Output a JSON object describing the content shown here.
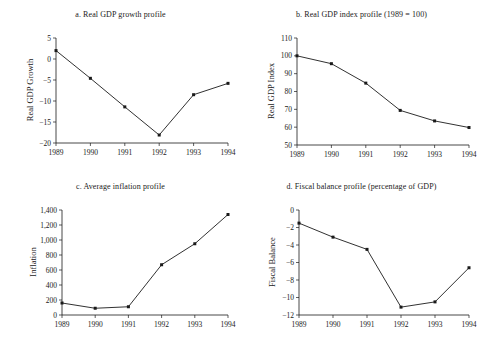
{
  "figure": {
    "background": "#ffffff",
    "ink": "#1a1a1a",
    "panels": [
      "a",
      "b",
      "c",
      "d"
    ]
  },
  "chart_data": [
    {
      "id": "a",
      "type": "line",
      "title": "a. Real GDP growth profile",
      "xlabel": "",
      "ylabel": "Real GDP Growth",
      "categories": [
        "1989",
        "1990",
        "1991",
        "1992",
        "1993",
        "1994"
      ],
      "x": [
        1989,
        1990,
        1991,
        1992,
        1993,
        1994
      ],
      "values": [
        2.0,
        -4.6,
        -11.4,
        -18.1,
        -8.5,
        -5.8
      ],
      "ylim": [
        -20,
        5
      ],
      "yticks": [
        5,
        0,
        -5,
        -10,
        -15,
        -20
      ],
      "ytick_labels": [
        "5",
        "0",
        "−5",
        "−10",
        "−15",
        "−20"
      ],
      "grid": false,
      "legend": "none",
      "marker": "square"
    },
    {
      "id": "b",
      "type": "line",
      "title": "b. Real GDP index profile (1989 = 100)",
      "xlabel": "",
      "ylabel": "Real GDP Index",
      "categories": [
        "1989",
        "1990",
        "1991",
        "1992",
        "1993",
        "1994"
      ],
      "x": [
        1989,
        1990,
        1991,
        1992,
        1993,
        1994
      ],
      "values": [
        100.0,
        95.6,
        84.7,
        69.4,
        63.5,
        59.8
      ],
      "ylim": [
        50,
        110
      ],
      "yticks": [
        110,
        100,
        90,
        80,
        70,
        60,
        50
      ],
      "ytick_labels": [
        "110",
        "100",
        "90",
        "80",
        "70",
        "60",
        "50"
      ],
      "grid": false,
      "legend": "none",
      "marker": "square"
    },
    {
      "id": "c",
      "type": "line",
      "title": "c. Average inflation profile",
      "xlabel": "",
      "ylabel": "Inflation",
      "categories": [
        "1989",
        "1990",
        "1991",
        "1992",
        "1993",
        "1994"
      ],
      "x": [
        1989,
        1990,
        1991,
        1992,
        1993,
        1994
      ],
      "values": [
        160,
        90,
        110,
        670,
        950,
        1340
      ],
      "ylim": [
        0,
        1400
      ],
      "yticks": [
        1400,
        1200,
        1000,
        800,
        600,
        400,
        200,
        0
      ],
      "ytick_labels": [
        "1,400",
        "1,200",
        "1,000",
        "800",
        "600",
        "400",
        "200",
        "0"
      ],
      "grid": false,
      "legend": "none",
      "marker": "square"
    },
    {
      "id": "d",
      "type": "line",
      "title": "d. Fiscal balance profile (percentage of GDP)",
      "xlabel": "",
      "ylabel": "Fiscal Balance",
      "categories": [
        "1989",
        "1990",
        "1991",
        "1992",
        "1993",
        "1994"
      ],
      "x": [
        1989,
        1990,
        1991,
        1992,
        1993,
        1994
      ],
      "values": [
        -1.5,
        -3.1,
        -4.5,
        -11.1,
        -10.5,
        -6.6
      ],
      "ylim": [
        -12,
        0
      ],
      "yticks": [
        0,
        -2,
        -4,
        -6,
        -8,
        -10,
        -12
      ],
      "ytick_labels": [
        "0",
        "−2",
        "−4",
        "−6",
        "−8",
        "−10",
        "−12"
      ],
      "grid": false,
      "legend": "none",
      "marker": "square"
    }
  ]
}
